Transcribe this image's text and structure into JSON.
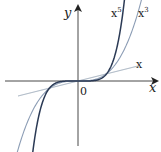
{
  "diagram": {
    "type": "function-graph",
    "axes": {
      "x_label": "x",
      "y_label": "y",
      "origin_label": "0"
    },
    "curves": [
      {
        "name": "x",
        "label": "x",
        "color": "#9aa8b8",
        "exponent": 1
      },
      {
        "name": "x3",
        "label_base": "x",
        "label_sup": "3",
        "color": "#8c9db5",
        "exponent": 3
      },
      {
        "name": "x5",
        "label_base": "x",
        "label_sup": "5",
        "color": "#2b3a55",
        "exponent": 5
      }
    ]
  }
}
